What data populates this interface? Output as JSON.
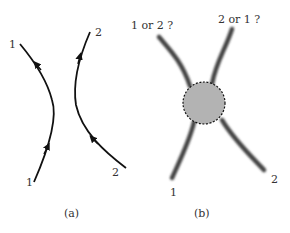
{
  "panel_a": {
    "caption": "(a)",
    "left_track": {
      "start_label": "1",
      "end_label": "1"
    },
    "right_track": {
      "start_label": "2",
      "end_label": "2"
    }
  },
  "panel_b": {
    "caption": "(b)",
    "top_left_label": "1 or 2 ?",
    "top_right_label": "2 or 1 ?",
    "bottom_left_label": "1",
    "bottom_right_label": "2",
    "interaction_region_color": "#b3b3b3"
  }
}
